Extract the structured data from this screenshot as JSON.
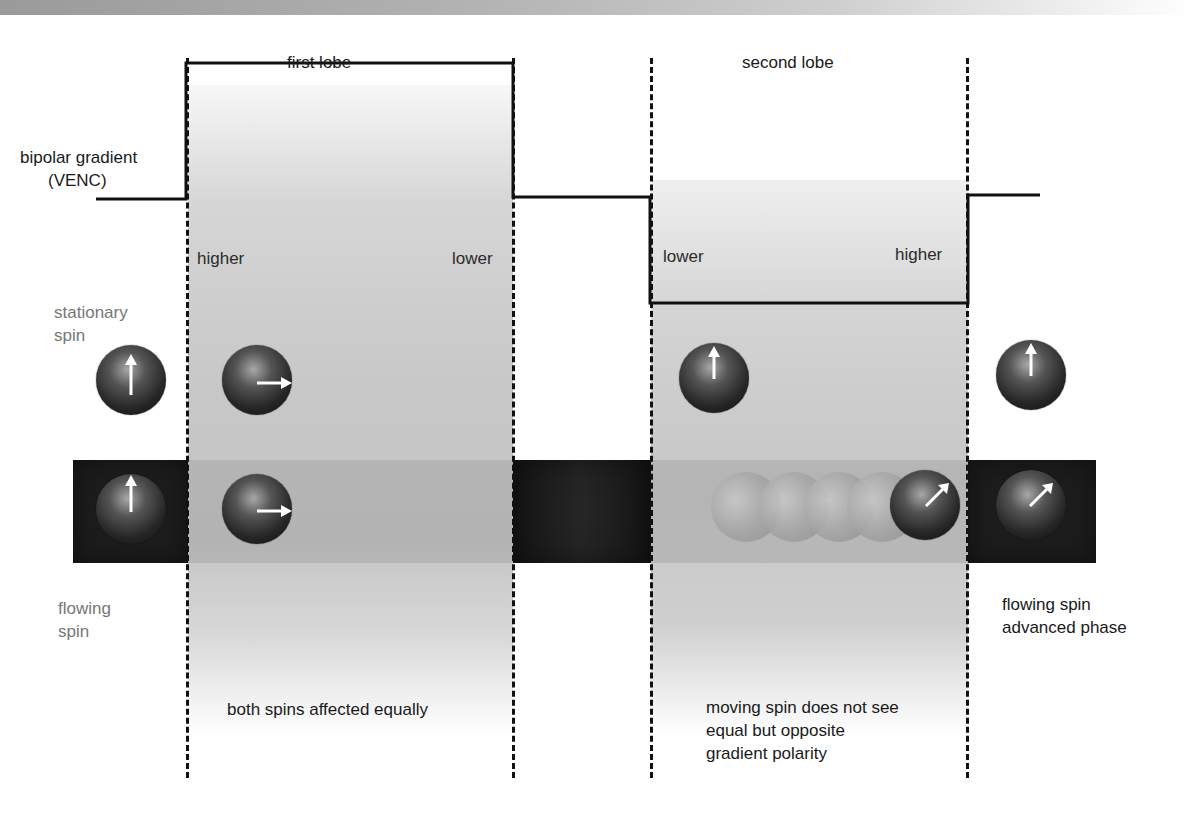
{
  "diagram": {
    "title_bar": "",
    "gradient_label_line1": "bipolar gradient",
    "gradient_label_line2": "(VENC)",
    "lobes": [
      {
        "label": "first lobe",
        "polarity": "positive",
        "left_label": "higher",
        "right_label": "lower",
        "caption": "both spins affected equally"
      },
      {
        "label": "second lobe",
        "polarity": "negative",
        "left_label": "lower",
        "right_label": "higher",
        "caption_line1": "moving spin does not see",
        "caption_line2": "equal but opposite",
        "caption_line3": "gradient polarity"
      }
    ],
    "stationary_label_line1": "stationary",
    "stationary_label_line2": "spin",
    "flowing_label_line1": "flowing",
    "flowing_label_line2": "spin",
    "result_label_line1": "flowing spin",
    "result_label_line2": "advanced phase",
    "spins": {
      "stationary": [
        {
          "stage": "initial",
          "arrow": "up"
        },
        {
          "stage": "after first lobe",
          "arrow": "right"
        },
        {
          "stage": "after second lobe",
          "arrow": "up"
        },
        {
          "stage": "final",
          "arrow": "up"
        }
      ],
      "flowing": [
        {
          "stage": "initial",
          "arrow": "up"
        },
        {
          "stage": "after first lobe",
          "arrow": "right"
        },
        {
          "stage": "moving during second lobe",
          "arrow": "up-right",
          "ghost_trail_count": 4
        },
        {
          "stage": "final",
          "arrow": "up-right"
        }
      ]
    },
    "colors": {
      "vessel": "#1d1d1d",
      "shading": "#c6c6c6",
      "line": "#111111",
      "muted_text": "#777777"
    }
  }
}
